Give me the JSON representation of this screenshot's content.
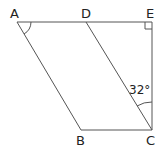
{
  "diagram": {
    "title": "",
    "points": {
      "A": {
        "label": "A"
      },
      "B": {
        "label": "B"
      },
      "C": {
        "label": "C"
      },
      "D": {
        "label": "D"
      },
      "E": {
        "label": "E"
      }
    },
    "angle_label": "32°",
    "segments": [
      "AE",
      "AB",
      "BC",
      "DC",
      "EC"
    ],
    "marks": [
      "angle arc at A",
      "angle arc at C (DCE)",
      "right angle at E"
    ],
    "colors": {
      "line": "#555555",
      "text": "#222222"
    }
  }
}
